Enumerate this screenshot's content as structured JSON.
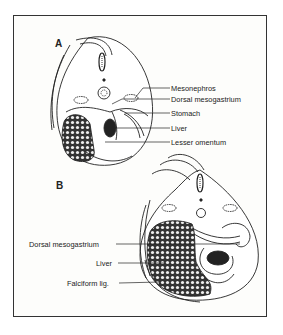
{
  "panels": [
    {
      "id": "A",
      "label": "A",
      "callouts": [
        {
          "text": "Mesonephros"
        },
        {
          "text": "Dorsal mesogastrium"
        },
        {
          "text": "Stomach"
        },
        {
          "text": "Liver"
        },
        {
          "text": "Lesser omentum"
        }
      ]
    },
    {
      "id": "B",
      "label": "B",
      "callouts": [
        {
          "text": "Dorsal mesogastrium"
        },
        {
          "text": "Liver"
        },
        {
          "text": "Falciform lig."
        }
      ]
    }
  ],
  "colors": {
    "line": "#222222",
    "background": "#fdfdfb",
    "frame": "#333333"
  }
}
